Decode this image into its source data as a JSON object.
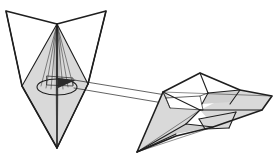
{
  "figure": {
    "title": "Two faceted polyhedral shapes linked by projection arrows",
    "background_color": "#ffffff",
    "stroke_color": "#1f1f1f",
    "fill_light": "#d9d9d9",
    "fill_mid": "#cfcfcf",
    "fill_dark": "#bdbdbd",
    "fill_white": "#ffffff",
    "fill_black": "#2b2b2b",
    "canvas": {
      "width": 277,
      "height": 158
    }
  },
  "shapes": {
    "left": {
      "label": "left-polyhedron",
      "view": "frontal",
      "vertices": {
        "top_left_wing": [
          6,
          11
        ],
        "top_right_wing": [
          106,
          11
        ],
        "top_center_notch": [
          57,
          24
        ],
        "bottom_apex": [
          57,
          148
        ],
        "mid_left": [
          24,
          85
        ],
        "mid_right": [
          86,
          83
        ]
      },
      "ellipse": {
        "cx": 57,
        "cy": 87,
        "rx": 20,
        "ry": 8
      },
      "axis": {
        "x1": 57,
        "y1": 24,
        "x2": 57,
        "y2": 148
      },
      "has_fan_lines": true,
      "fan_line_count": 7
    },
    "right": {
      "label": "right-polyhedron",
      "view": "oblique-foreshortened",
      "vertices": {
        "nose": [
          137,
          152
        ],
        "upper_peak": [
          200,
          73
        ],
        "left_wing_tip": [
          160,
          98
        ],
        "right_wing_tip": [
          272,
          98
        ],
        "tail_lower": [
          213,
          127
        ],
        "keel": [
          185,
          120
        ]
      },
      "has_internal_arrowhead": true
    }
  },
  "connectors": {
    "label": "projection-lines",
    "count": 2,
    "upper_line": {
      "x1": 72,
      "y1": 83,
      "x2": 170,
      "y2": 97
    },
    "lower_line": {
      "x1": 74,
      "y1": 90,
      "x2": 168,
      "y2": 103
    },
    "arrowheads": [
      {
        "name": "left-arrowhead",
        "x": 72,
        "y": 82,
        "direction": "right"
      },
      {
        "name": "right-arrowhead",
        "x": 168,
        "y": 100,
        "direction": "left"
      }
    ]
  }
}
